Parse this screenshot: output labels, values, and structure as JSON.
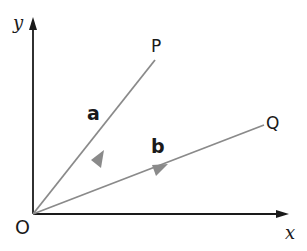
{
  "diagram": {
    "type": "vector-diagram",
    "axes": {
      "x_label": "x",
      "y_label": "y",
      "origin_label": "O"
    },
    "points": [
      {
        "name": "P",
        "label": "P"
      },
      {
        "name": "Q",
        "label": "Q"
      }
    ],
    "vectors": [
      {
        "name": "a",
        "label": "a",
        "from": "O",
        "to": "P"
      },
      {
        "name": "b",
        "label": "b",
        "from": "O",
        "to": "Q"
      }
    ],
    "colors": {
      "axis": "#1a1a1a",
      "vector": "#8a8a8a",
      "background": "#ffffff"
    }
  }
}
